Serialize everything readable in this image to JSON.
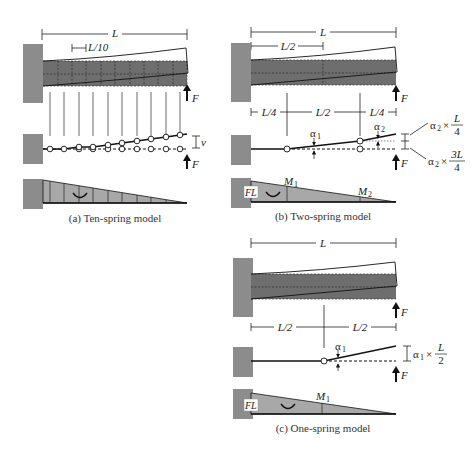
{
  "colors": {
    "wall": "#8c8c8c",
    "beam": "#6e6e6e",
    "moment": "#a8a8a8",
    "line": "#111111"
  },
  "panel_a": {
    "span_label": "L",
    "segment_label": "L/10",
    "force_label": "F",
    "deflection_label": "v",
    "caption": "(a) Ten-spring model"
  },
  "panel_b": {
    "span_label": "L",
    "half_label": "L/2",
    "dims": [
      "L/4",
      "L/2",
      "L/4"
    ],
    "alpha1": "α",
    "alpha1_sub": "1",
    "alpha2": "α",
    "alpha2_sub": "2",
    "ann_top_prefix": "α",
    "ann_top_sub": "2",
    "ann_top_times": "×",
    "ann_top_num": "L",
    "ann_top_den": "4",
    "ann_bot_prefix": "α",
    "ann_bot_sub": "2",
    "ann_bot_times": "×",
    "ann_bot_num": "3L",
    "ann_bot_den": "4",
    "force_label": "F",
    "fl_label": "FL",
    "m1": "M",
    "m1_sub": "1",
    "m2": "M",
    "m2_sub": "2",
    "caption": "(b) Two-spring model"
  },
  "panel_c": {
    "span_label": "L",
    "dims": [
      "L/2",
      "L/2"
    ],
    "alpha1": "α",
    "alpha1_sub": "1",
    "ann_prefix": "α",
    "ann_sub": "1",
    "ann_times": "×",
    "ann_num": "L",
    "ann_den": "2",
    "force_label": "F",
    "fl_label": "FL",
    "m1": "M",
    "m1_sub": "1",
    "caption": "(c) One-spring model"
  }
}
